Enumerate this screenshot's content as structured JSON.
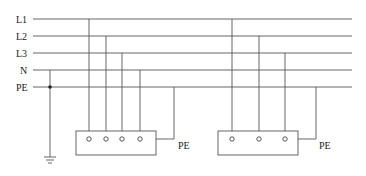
{
  "diagram": {
    "type": "TN-S power distribution system",
    "buses": [
      {
        "label": "L1",
        "y": 19
      },
      {
        "label": "L2",
        "y": 36
      },
      {
        "label": "L3",
        "y": 53
      },
      {
        "label": "N",
        "y": 70
      },
      {
        "label": "PE",
        "y": 87
      }
    ],
    "loads": [
      {
        "name": "load-1",
        "terminals": 4,
        "pe_label": "PE"
      },
      {
        "name": "load-2",
        "terminals": 3,
        "pe_label": "PE"
      }
    ],
    "ground_symbol": "earth-ground",
    "colors": {
      "line": "#555555",
      "text": "#222222",
      "background": "#ffffff"
    }
  }
}
